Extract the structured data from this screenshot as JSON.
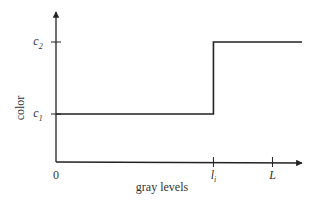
{
  "chart_data": {
    "type": "line",
    "title": "",
    "xlabel": "gray levels",
    "ylabel": "color",
    "x_ticks": [
      {
        "label": "0",
        "value": 0,
        "tick_mark": false
      },
      {
        "label": "l",
        "sub": "i",
        "value": 0.64,
        "tick_mark": true
      },
      {
        "label": "L",
        "sub": "",
        "value": 0.88,
        "tick_mark": true
      }
    ],
    "y_ticks": [
      {
        "label": "c",
        "sub": "1",
        "value": 0.32
      },
      {
        "label": "c",
        "sub": "2",
        "value": 0.8
      }
    ],
    "xlim": [
      0,
      1.0
    ],
    "ylim": [
      0,
      1.0
    ],
    "grid": false,
    "legend": "none",
    "series": [
      {
        "name": "step function",
        "description": "color equals c1 below threshold l_i and c2 at or above it",
        "points": [
          {
            "x": 0.0,
            "y": 0.32
          },
          {
            "x": 0.64,
            "y": 0.32
          },
          {
            "x": 0.64,
            "y": 0.8
          },
          {
            "x": 1.0,
            "y": 0.8
          }
        ]
      }
    ]
  }
}
